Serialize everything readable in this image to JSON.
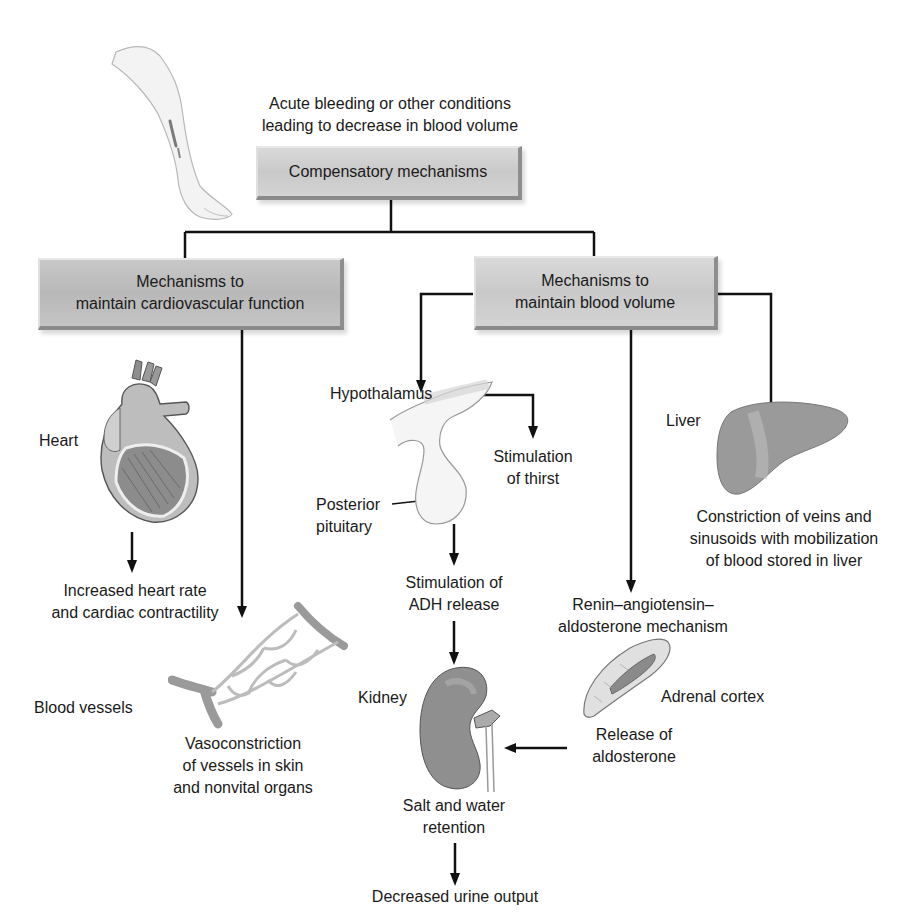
{
  "diagram": {
    "type": "flowchart",
    "trigger": "Acute bleeding or other conditions leading to decrease in blood volume",
    "root": "Compensatory mechanisms",
    "branches": [
      {
        "title_line1": "Mechanisms to",
        "title_line2": "maintain cardiovascular function"
      },
      {
        "title_line1": "Mechanisms to",
        "title_line2": "maintain blood volume"
      }
    ]
  },
  "labels": {
    "trigger_line1": "Acute bleeding or other conditions",
    "trigger_line2": "leading to decrease in blood volume",
    "root_box": "Compensatory mechanisms",
    "cardio_box_line1": "Mechanisms to",
    "cardio_box_line2": "maintain cardiovascular function",
    "volume_box_line1": "Mechanisms to",
    "volume_box_line2": "maintain blood volume",
    "heart": "Heart",
    "heart_result_line1": "Increased heart rate",
    "heart_result_line2": "and cardiac contractility",
    "blood_vessels": "Blood vessels",
    "vaso_line1": "Vasoconstriction",
    "vaso_line2": "of vessels in skin",
    "vaso_line3": "and nonvital organs",
    "hypothalamus": "Hypothalamus",
    "thirst_line1": "Stimulation",
    "thirst_line2": "of thirst",
    "posterior_line1": "Posterior",
    "posterior_line2": "pituitary",
    "adh_line1": "Stimulation of",
    "adh_line2": "ADH release",
    "kidney": "Kidney",
    "salt_line1": "Salt and water",
    "salt_line2": "retention",
    "urine": "Decreased urine output",
    "raas_line1": "Renin–angiotensin–",
    "raas_line2": "aldosterone mechanism",
    "adrenal": "Adrenal cortex",
    "aldo_line1": "Release of",
    "aldo_line2": "aldosterone",
    "liver": "Liver",
    "liver_result_line1": "Constriction of veins and",
    "liver_result_line2": "sinusoids with mobilization",
    "liver_result_line3": "of blood stored in liver"
  },
  "illustrations": [
    "leg",
    "heart",
    "blood-vessels",
    "hypothalamus-pituitary",
    "kidney",
    "adrenal-cortex",
    "liver"
  ],
  "colors": {
    "box_fill": "#cfcfcf",
    "box_shadow_edge": "#8a8a8a",
    "line": "#111111",
    "organ_fill": "#9a9a9a"
  }
}
